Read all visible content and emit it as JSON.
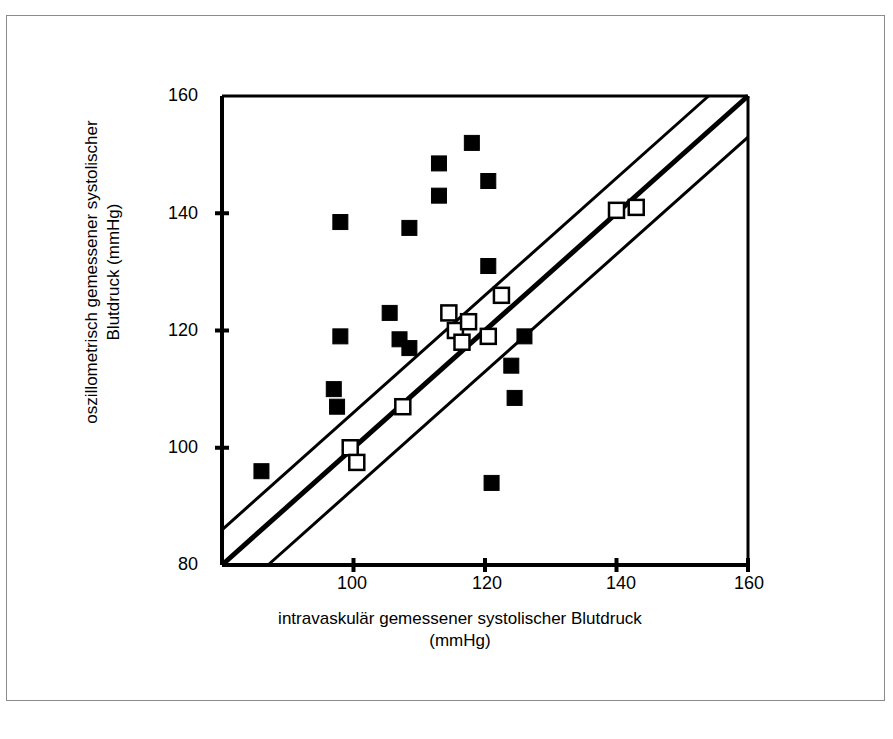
{
  "figure": {
    "title": "",
    "y_axis_title": "oszillometrisch gemessener systolischer Blutdruck (mmHg)",
    "x_axis_title_line1": "intravaskulär gemessener systolischer Blutdruck",
    "x_axis_title_line2": "(mmHg)",
    "ink_color": "#000000",
    "background_color": "#ffffff",
    "frame_color": "#8b8b8b"
  },
  "chart_data": {
    "type": "scatter",
    "title": "",
    "xlabel": "intravaskulär gemessener systolischer Blutdruck (mmHg)",
    "ylabel": "oszillometrisch gemessener systolischer Blutdruck (mmHg)",
    "xlim": [
      80,
      160
    ],
    "ylim": [
      80,
      160
    ],
    "xticks": [
      80,
      100,
      120,
      140,
      160
    ],
    "yticks": [
      80,
      100,
      120,
      140,
      160
    ],
    "xticklabels": [
      "80",
      "100",
      "120",
      "140",
      "160"
    ],
    "yticklabels": [
      "80",
      "100",
      "120",
      "140",
      "160"
    ],
    "grid": false,
    "legend": null,
    "series": [
      {
        "name": "filled-squares",
        "marker": "filled-square",
        "fill": "#000000",
        "stroke": "#000000",
        "size": 15,
        "points": [
          [
            86,
            96
          ],
          [
            98,
            138.5
          ],
          [
            98,
            119
          ],
          [
            97,
            110
          ],
          [
            97.5,
            107
          ],
          [
            105.5,
            123
          ],
          [
            107,
            118.5
          ],
          [
            108.5,
            117
          ],
          [
            108.5,
            137.5
          ],
          [
            113,
            148.5
          ],
          [
            113,
            143
          ],
          [
            118,
            152
          ],
          [
            120.5,
            145.5
          ],
          [
            120.5,
            131
          ],
          [
            121,
            94
          ],
          [
            124,
            114
          ],
          [
            124.5,
            108.5
          ],
          [
            126,
            119
          ]
        ]
      },
      {
        "name": "open-squares",
        "marker": "open-square",
        "fill": "#ffffff",
        "stroke": "#000000",
        "size": 15,
        "points": [
          [
            99.5,
            100
          ],
          [
            100.5,
            97.5
          ],
          [
            107.5,
            107
          ],
          [
            114.5,
            123
          ],
          [
            115.5,
            120
          ],
          [
            116.5,
            118
          ],
          [
            117.5,
            121.5
          ],
          [
            120.5,
            119
          ],
          [
            122.5,
            126
          ],
          [
            140,
            140.5
          ],
          [
            143,
            141
          ]
        ]
      }
    ],
    "reference_lines": [
      {
        "name": "identity-line",
        "description": "line of identity y = x",
        "from": [
          80,
          80
        ],
        "to": [
          160,
          160
        ],
        "width": 5,
        "color": "#000000"
      },
      {
        "name": "upper-limit-line",
        "description": "upper agreement limit y = x + 6",
        "from": [
          80,
          86
        ],
        "to": [
          154,
          160
        ],
        "width": 3,
        "color": "#000000"
      },
      {
        "name": "lower-limit-line",
        "description": "lower agreement limit y = x - 7",
        "from": [
          87,
          80
        ],
        "to": [
          160,
          153
        ],
        "width": 3,
        "color": "#000000"
      }
    ]
  }
}
